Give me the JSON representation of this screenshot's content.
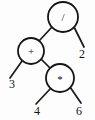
{
  "diagram": {
    "expression": "(3 + 4 * 6) / 2",
    "background_color": "#fdfdfd",
    "stroke_color": "#151515",
    "text_color": "#111111"
  },
  "nodes": {
    "root": {
      "label": "/",
      "kind": "operator",
      "name": "divide",
      "cx": 63,
      "cy": 17,
      "r": 15
    },
    "plus": {
      "label": "+",
      "kind": "operator",
      "name": "add",
      "cx": 31,
      "cy": 51,
      "r": 13
    },
    "times": {
      "label": "*",
      "kind": "operator",
      "name": "multiply",
      "cx": 60,
      "cy": 78,
      "r": 14
    },
    "leaf_two": {
      "label": "2",
      "kind": "operand",
      "name": "two",
      "cx": 82,
      "cy": 54
    },
    "leaf_three": {
      "label": "3",
      "kind": "operand",
      "name": "three",
      "cx": 12,
      "cy": 84
    },
    "leaf_four": {
      "label": "4",
      "kind": "operand",
      "name": "four",
      "cx": 37,
      "cy": 111
    },
    "leaf_six": {
      "label": "6",
      "kind": "operand",
      "name": "six",
      "cx": 79,
      "cy": 111
    }
  },
  "edges": [
    {
      "name": "edge-root-to-plus",
      "from": "root",
      "to": "plus",
      "x1": 52,
      "y1": 27,
      "x2": 39,
      "y2": 41
    },
    {
      "name": "edge-root-to-two",
      "from": "root",
      "to": "leaf_two",
      "x1": 74,
      "y1": 27,
      "x2": 84,
      "y2": 47
    },
    {
      "name": "edge-plus-to-three",
      "from": "plus",
      "to": "leaf_three",
      "x1": 22,
      "y1": 61,
      "x2": 10,
      "y2": 78
    },
    {
      "name": "edge-plus-to-times",
      "from": "plus",
      "to": "times",
      "x1": 41,
      "y1": 59,
      "x2": 51,
      "y2": 69
    },
    {
      "name": "edge-times-to-four",
      "from": "times",
      "to": "leaf_four",
      "x1": 51,
      "y1": 88,
      "x2": 36,
      "y2": 104
    },
    {
      "name": "edge-times-to-six",
      "from": "times",
      "to": "leaf_six",
      "x1": 70,
      "y1": 87,
      "x2": 81,
      "y2": 103
    }
  ]
}
